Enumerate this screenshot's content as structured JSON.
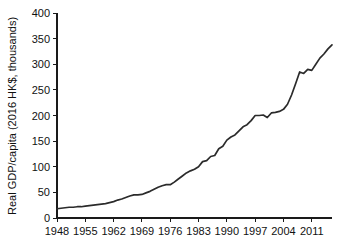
{
  "chart_data": {
    "type": "line",
    "title": "",
    "subtitle": "",
    "xlabel": "",
    "ylabel": "Real GDP/capita (2016 HK$, thousands)",
    "xlim": [
      1948,
      2016
    ],
    "ylim": [
      0,
      400
    ],
    "grid": false,
    "legend": null,
    "legend_position": "none",
    "y_ticks": [
      0,
      50,
      100,
      150,
      200,
      250,
      300,
      350,
      400
    ],
    "y_tick_labels": [
      "0",
      "50",
      "100",
      "150",
      "200",
      "250",
      "300",
      "350",
      "400"
    ],
    "x_ticks": [
      1948,
      1955,
      1962,
      1969,
      1976,
      1983,
      1990,
      1997,
      2004,
      2011
    ],
    "x_tick_labels": [
      "1948",
      "1955",
      "1962",
      "1969",
      "1976",
      "1983",
      "1990",
      "1997",
      "2004",
      "2011"
    ],
    "series": [
      {
        "name": "Real GDP per capita",
        "color": "#2b2b2b",
        "x": [
          1948,
          1949,
          1950,
          1951,
          1952,
          1953,
          1954,
          1955,
          1956,
          1957,
          1958,
          1959,
          1960,
          1961,
          1962,
          1963,
          1964,
          1965,
          1966,
          1967,
          1968,
          1969,
          1970,
          1971,
          1972,
          1973,
          1974,
          1975,
          1976,
          1977,
          1978,
          1979,
          1980,
          1981,
          1982,
          1983,
          1984,
          1985,
          1986,
          1987,
          1988,
          1989,
          1990,
          1991,
          1992,
          1993,
          1994,
          1995,
          1996,
          1997,
          1998,
          1999,
          2000,
          2001,
          2002,
          2003,
          2004,
          2005,
          2006,
          2007,
          2008,
          2009,
          2010,
          2011,
          2012,
          2013,
          2014,
          2015,
          2016
        ],
        "values": [
          18,
          19,
          20,
          21,
          21,
          22,
          22,
          23,
          24,
          25,
          26,
          27,
          28,
          30,
          32,
          35,
          37,
          40,
          43,
          45,
          45,
          46,
          49,
          52,
          56,
          60,
          63,
          65,
          65,
          70,
          76,
          82,
          88,
          92,
          95,
          100,
          110,
          112,
          120,
          122,
          135,
          140,
          152,
          158,
          162,
          170,
          178,
          182,
          190,
          200,
          200,
          201,
          196,
          205,
          206,
          208,
          212,
          222,
          240,
          262,
          285,
          282,
          290,
          288,
          300,
          312,
          320,
          330,
          338
        ]
      }
    ]
  },
  "axis": {
    "y_title": "Real GDP/capita (2016 HK$, thousands)"
  }
}
